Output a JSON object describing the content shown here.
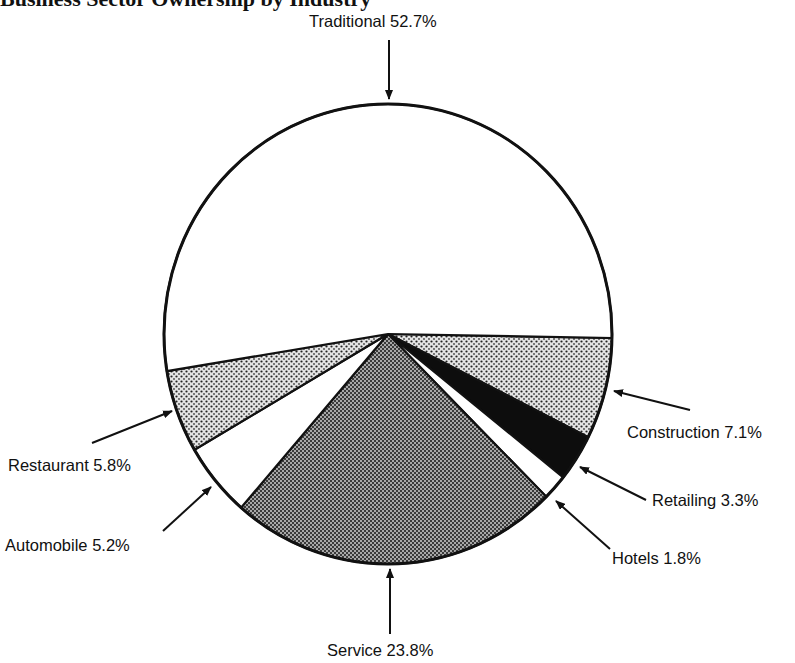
{
  "chart_data": {
    "type": "pie",
    "title": "Business Sector Ownership by Industry",
    "title_visible": "cropped",
    "start_slice": "Construction",
    "direction": "clockwise",
    "slices": [
      {
        "label": "Construction",
        "value": 7.1,
        "pattern": "light-dots",
        "display": "Construction 7.1%"
      },
      {
        "label": "Retailing",
        "value": 3.3,
        "pattern": "black",
        "display": "Retailing 3.3%"
      },
      {
        "label": "Hotels",
        "value": 1.8,
        "pattern": "white",
        "display": "Hotels 1.8%"
      },
      {
        "label": "Service",
        "value": 23.8,
        "pattern": "dark-checker",
        "display": "Service 23.8%"
      },
      {
        "label": "Automobile",
        "value": 5.2,
        "pattern": "white",
        "display": "Automobile 5.2%"
      },
      {
        "label": "Restaurant",
        "value": 5.8,
        "pattern": "light-dots",
        "display": "Restaurant 5.8%"
      },
      {
        "label": "Traditional",
        "value": 52.7,
        "pattern": "white",
        "display": "Traditional 52.7%"
      }
    ],
    "unit": "%",
    "legend": "none",
    "labels": "callout-arrows"
  }
}
